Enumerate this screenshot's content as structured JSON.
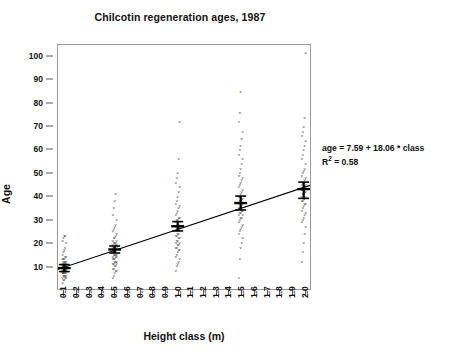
{
  "chart": {
    "title": "Chilcotin regeneration ages, 1987",
    "xlabel": "Height class (m)",
    "ylabel": "Age",
    "annotation_equation": "age = 7.59 + 18.06 * class",
    "annotation_r2_prefix": "R",
    "annotation_r2_sup": "2",
    "annotation_r2_value": " = 0.58"
  },
  "chart_data": {
    "type": "scatter",
    "title": "Chilcotin regeneration ages, 1987",
    "xlabel": "Height class (m)",
    "ylabel": "Age",
    "xlim": [
      0.05,
      2.05
    ],
    "ylim": [
      0,
      105
    ],
    "grid": false,
    "legend": null,
    "xticks": [
      "0.1",
      "0.2",
      "0.3",
      "0.4",
      "0.5",
      "0.6",
      "0.7",
      "0.8",
      "0.9",
      "1.0",
      "1.1",
      "1.2",
      "1.3",
      "1.4",
      "1.5",
      "1.6",
      "1.7",
      "1.8",
      "1.9",
      "2.0"
    ],
    "xtick_values": [
      0.1,
      0.2,
      0.3,
      0.4,
      0.5,
      0.6,
      0.7,
      0.8,
      0.9,
      1.0,
      1.1,
      1.2,
      1.3,
      1.4,
      1.5,
      1.6,
      1.7,
      1.8,
      1.9,
      2.0
    ],
    "yticks": [
      "10",
      "20",
      "30",
      "40",
      "50",
      "60",
      "70",
      "80",
      "90",
      "100"
    ],
    "ytick_values": [
      10,
      20,
      30,
      40,
      50,
      60,
      70,
      80,
      90,
      100
    ],
    "marker_glyph": "v",
    "marker_color": "#333333",
    "series": [
      {
        "name": "Chilcotin regeneration ages",
        "groups": [
          {
            "x": 0.1,
            "mean": 9,
            "err_low": 7.5,
            "err_high": 10.5,
            "y": [
              3,
              4,
              4,
              5,
              5,
              5,
              6,
              6,
              6,
              6,
              7,
              7,
              7,
              7,
              7,
              7,
              8,
              8,
              8,
              8,
              8,
              8,
              8,
              9,
              9,
              9,
              9,
              9,
              9,
              9,
              10,
              10,
              10,
              10,
              10,
              10,
              11,
              11,
              11,
              11,
              11,
              12,
              12,
              12,
              12,
              13,
              13,
              13,
              14,
              14,
              15,
              16,
              17,
              18,
              20,
              21,
              22,
              23,
              23
            ]
          },
          {
            "x": 0.5,
            "mean": 17,
            "err_low": 15.5,
            "err_high": 18.5,
            "y": [
              5,
              6,
              7,
              8,
              8,
              9,
              9,
              10,
              10,
              11,
              11,
              11,
              12,
              12,
              12,
              13,
              13,
              13,
              14,
              14,
              14,
              15,
              15,
              15,
              15,
              16,
              16,
              16,
              16,
              17,
              17,
              17,
              17,
              17,
              18,
              18,
              18,
              18,
              19,
              19,
              19,
              20,
              20,
              20,
              21,
              21,
              22,
              22,
              23,
              24,
              25,
              26,
              27,
              28,
              30,
              32,
              35,
              38,
              41
            ]
          },
          {
            "x": 1.0,
            "mean": 27,
            "err_low": 25,
            "err_high": 29,
            "y": [
              8,
              10,
              11,
              12,
              13,
              14,
              15,
              16,
              17,
              17,
              18,
              18,
              19,
              19,
              20,
              20,
              21,
              21,
              22,
              22,
              23,
              23,
              24,
              24,
              25,
              25,
              25,
              26,
              26,
              27,
              27,
              27,
              28,
              28,
              29,
              29,
              30,
              30,
              31,
              31,
              32,
              33,
              34,
              35,
              36,
              37,
              38,
              40,
              42,
              44,
              46,
              48,
              50,
              56,
              72
            ]
          },
          {
            "x": 1.5,
            "mean": 37,
            "err_low": 34,
            "err_high": 40,
            "y": [
              5,
              13,
              18,
              20,
              22,
              24,
              25,
              26,
              27,
              28,
              29,
              30,
              31,
              31,
              32,
              32,
              33,
              33,
              34,
              34,
              35,
              35,
              36,
              36,
              37,
              37,
              38,
              38,
              39,
              39,
              40,
              40,
              41,
              42,
              43,
              44,
              45,
              46,
              47,
              48,
              49,
              50,
              52,
              54,
              56,
              58,
              60,
              62,
              65,
              68,
              72,
              76,
              85
            ]
          },
          {
            "x": 2.0,
            "mean": 43,
            "err_low": 39,
            "err_high": 46,
            "y": [
              12,
              16,
              20,
              24,
              27,
              29,
              30,
              31,
              32,
              33,
              34,
              35,
              36,
              37,
              37,
              38,
              38,
              39,
              39,
              40,
              40,
              41,
              41,
              42,
              42,
              43,
              43,
              44,
              44,
              45,
              45,
              46,
              46,
              47,
              48,
              49,
              50,
              51,
              52,
              54,
              56,
              58,
              60,
              62,
              64,
              66,
              68,
              70,
              74,
              102
            ]
          }
        ]
      }
    ],
    "regression": {
      "intercept": 7.59,
      "slope": 18.06,
      "r_squared": 0.58,
      "equation_text": "age = 7.59 + 18.06 * class",
      "x_start": 0.05,
      "x_end": 2.05
    }
  }
}
